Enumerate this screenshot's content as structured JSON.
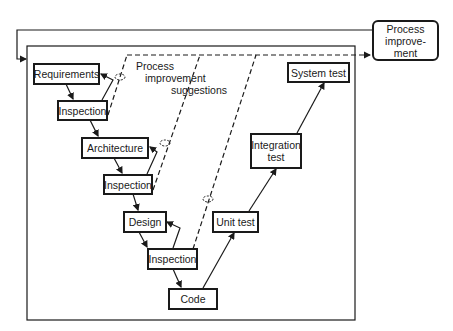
{
  "diagram": {
    "type": "process-flow-v-model",
    "nodes": {
      "requirements": "Requirements",
      "inspection1": "Inspection",
      "architecture": "Architecture",
      "inspection2": "Inspection",
      "design": "Design",
      "inspection3": "Inspection",
      "code": "Code",
      "unit_test": "Unit test",
      "integration_test": "Integration test",
      "system_test": "System test",
      "process_improvement": "Process improve-ment"
    },
    "labels": {
      "suggestions_line1": "Process",
      "suggestions_line2": "improvement",
      "suggestions_line3": "suggestions"
    },
    "process_improvement_lines": [
      "Process",
      "improve-",
      "ment"
    ],
    "integration_test_lines": [
      "Integration",
      "test"
    ],
    "edges": [
      {
        "from": "Requirements",
        "to": "Inspection"
      },
      {
        "from": "Inspection",
        "to": "Requirements",
        "type": "feedback"
      },
      {
        "from": "Inspection",
        "to": "Architecture"
      },
      {
        "from": "Inspection",
        "to": "Architecture",
        "type": "feedback"
      },
      {
        "from": "Inspection",
        "to": "Design"
      },
      {
        "from": "Inspection",
        "to": "Design",
        "type": "feedback"
      },
      {
        "from": "Inspection",
        "to": "Code"
      },
      {
        "from": "Code",
        "to": "Unit test"
      },
      {
        "from": "Unit test",
        "to": "Integration test"
      },
      {
        "from": "Integration test",
        "to": "System test"
      },
      {
        "from": "Inspections",
        "to": "Process improvement",
        "type": "dashed",
        "label": "Process improvement suggestions"
      },
      {
        "from": "Process improvement",
        "to": "Process frame",
        "type": "feedback"
      }
    ]
  }
}
